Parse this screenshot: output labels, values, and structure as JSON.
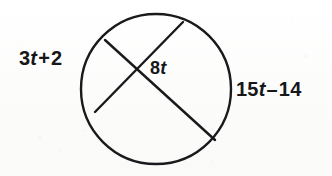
{
  "figure": {
    "kind": "circle-with-two-intersecting-chords",
    "stroke_color": "#1a1a1d",
    "background_color": "#fdfdfc",
    "text_color": "#17171a",
    "circle": {
      "center_x": 156,
      "center_y": 89,
      "radius": 75,
      "stroke_width": 2.4
    },
    "chords": [
      {
        "name": "chord-upper-left-to-lower-right",
        "x1": 105,
        "y1": 40,
        "x2": 215,
        "y2": 140,
        "stroke_width": 2.4
      },
      {
        "name": "chord-upper-right-to-lower-left",
        "x1": 183,
        "y1": 22,
        "x2": 95,
        "y2": 112,
        "stroke_width": 2.4
      }
    ],
    "intersection": {
      "x": 138,
      "y": 72
    }
  },
  "labels": {
    "left": {
      "text": "3t + 2",
      "coefficient": "3",
      "variable": "t",
      "operator": "+",
      "constant": "2"
    },
    "center": {
      "text": "8t",
      "coefficient": "8",
      "variable": "t"
    },
    "right": {
      "text": "15t – 14",
      "coefficient": "15",
      "variable": "t",
      "operator": "–",
      "constant": "14"
    }
  }
}
